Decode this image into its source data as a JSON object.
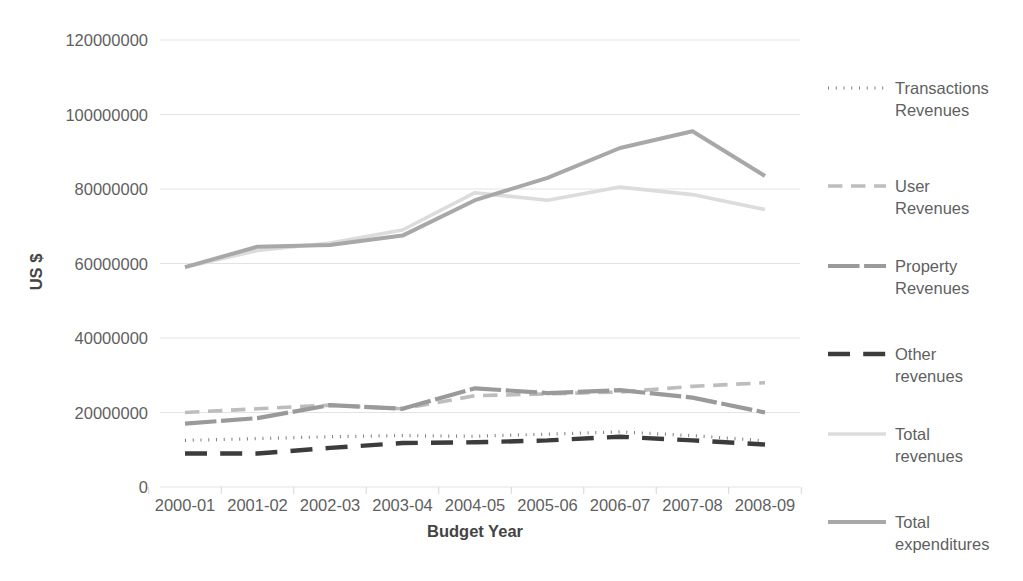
{
  "chart_data": {
    "type": "line",
    "title": "",
    "xlabel": "Budget Year",
    "ylabel": "US $",
    "categories": [
      "2000-01",
      "2001-02",
      "2002-03",
      "2003-04",
      "2004-05",
      "2005-06",
      "2006-07",
      "2007-08",
      "2008-09"
    ],
    "ylim": [
      0,
      120000000
    ],
    "yticks": [
      0,
      20000000,
      40000000,
      60000000,
      80000000,
      100000000,
      120000000
    ],
    "ytick_labels": [
      "0",
      "20000000",
      "40000000",
      "60000000",
      "80000000",
      "100000000",
      "120000000"
    ],
    "grid": true,
    "legend_position": "right",
    "series": [
      {
        "name": "Transactions Revenues",
        "style": "dotted",
        "color": "#808080",
        "width": 3.2,
        "values": [
          12500000,
          13000000,
          13500000,
          13800000,
          13600000,
          14200000,
          14800000,
          13800000,
          12400000
        ]
      },
      {
        "name": "User Revenues",
        "style": "dashed",
        "color": "#bdbdbd",
        "width": 3.6,
        "values": [
          20000000,
          21000000,
          22000000,
          21000000,
          24500000,
          25000000,
          25500000,
          27000000,
          28000000
        ]
      },
      {
        "name": "Property Revenues",
        "style": "solid-thick",
        "color": "#9a9a9a",
        "width": 4.2,
        "values": [
          17000000,
          18500000,
          22000000,
          21000000,
          26500000,
          25200000,
          26000000,
          24000000,
          20000000
        ]
      },
      {
        "name": "Other revenues",
        "style": "dashed-heavy",
        "color": "#3c3c3c",
        "width": 4.4,
        "values": [
          9000000,
          9000000,
          10500000,
          11800000,
          12000000,
          12500000,
          13500000,
          12500000,
          11400000
        ]
      },
      {
        "name": "Total revenues",
        "style": "solid",
        "color": "#dcdcdc",
        "width": 3.6,
        "values": [
          59000000,
          63500000,
          65500000,
          69000000,
          79000000,
          77000000,
          80500000,
          78500000,
          74500000
        ]
      },
      {
        "name": "Total expenditures",
        "style": "solid",
        "color": "#a8a8a8",
        "width": 4.0,
        "values": [
          59000000,
          64500000,
          65000000,
          67500000,
          77000000,
          83000000,
          91000000,
          95500000,
          83500000
        ]
      }
    ]
  },
  "legend": {
    "entries": [
      {
        "label_line1": "Transactions",
        "label_line2": "Revenues",
        "series": "Transactions Revenues"
      },
      {
        "label_line1": "User",
        "label_line2": "Revenues",
        "series": "User Revenues"
      },
      {
        "label_line1": "Property",
        "label_line2": "Revenues",
        "series": "Property Revenues"
      },
      {
        "label_line1": "Other",
        "label_line2": "revenues",
        "series": "Other revenues"
      },
      {
        "label_line1": "Total",
        "label_line2": "revenues",
        "series": "Total revenues"
      },
      {
        "label_line1": "Total",
        "label_line2": "expenditures",
        "series": "Total expenditures"
      }
    ]
  },
  "colors": {
    "grid": "#e3e3e3",
    "text": "#5f5f5f",
    "axis_title": "#444444",
    "background": "#ffffff"
  }
}
